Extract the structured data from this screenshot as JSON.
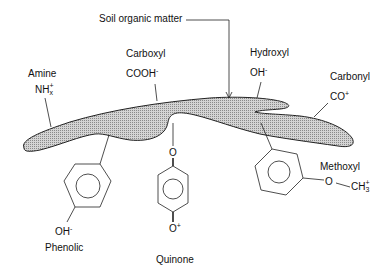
{
  "diagram": {
    "title_label": "Soil organic matter",
    "groups": {
      "amine": {
        "name": "Amine",
        "formula_base": "NH",
        "formula_sup": "+",
        "formula_sub": "x"
      },
      "carboxyl": {
        "name": "Carboxyl",
        "formula_base": "COOH",
        "formula_sup": "-"
      },
      "hydroxyl": {
        "name": "Hydroxyl",
        "formula_base": "OH",
        "formula_sup": "-"
      },
      "carbonyl": {
        "name": "Carbonyl",
        "formula_base": "CO",
        "formula_sup": "+"
      },
      "methoxyl": {
        "name": "Methoxyl",
        "bridge_atom": "O",
        "formula_base": "CH",
        "formula_sup": "+",
        "formula_sub": "3"
      },
      "phenolic": {
        "name": "Phenolic",
        "formula_base": "OH",
        "formula_sup": "-"
      },
      "quinone": {
        "name": "Quinone",
        "top_atom": "O",
        "bottom_atom": "O",
        "bottom_sup": "+"
      }
    },
    "colors": {
      "blob_fill": "#b8b8b8",
      "stroke": "#222222"
    }
  }
}
